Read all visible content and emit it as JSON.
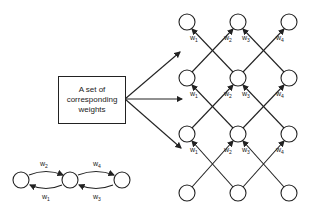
{
  "box": {
    "label": "A set of corresponding weights"
  },
  "grid_weights": [
    "w1",
    "w2",
    "w3",
    "w4"
  ],
  "chain_weights": {
    "top": [
      "w2",
      "w4"
    ],
    "bottom": [
      "w1",
      "w3"
    ]
  },
  "colors": {
    "stroke": "#222222",
    "background": "#ffffff"
  }
}
